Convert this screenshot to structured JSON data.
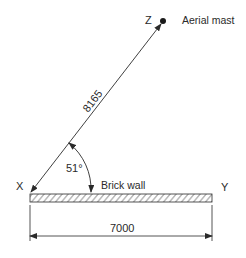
{
  "diagram": {
    "points": {
      "z": {
        "label": "Z"
      },
      "x": {
        "label": "X"
      },
      "y": {
        "label": "Y"
      }
    },
    "mast_label": "Aerial mast",
    "wall_label": "Brick wall",
    "line_xz_length": "8165",
    "angle": "51°",
    "wall_length": "7000",
    "colors": {
      "line": "#2a2a2a",
      "background": "#ffffff"
    }
  }
}
